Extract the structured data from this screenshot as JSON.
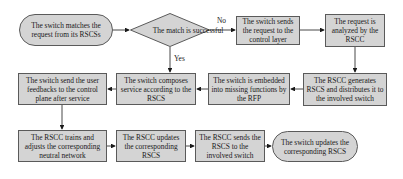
{
  "diagram": {
    "type": "flowchart",
    "colors": {
      "node_fill": "#d4d4d4",
      "node_border": "#5a5a5a",
      "arrow": "#1a1a1a"
    },
    "nodes": {
      "start": {
        "shape": "rounded",
        "text": "The switch matches the request from its RSCSs"
      },
      "decision": {
        "shape": "diamond",
        "text": "The match is successful"
      },
      "send_request": {
        "shape": "rect",
        "text": "The switch sends the request to the control layer"
      },
      "analyzed": {
        "shape": "rect",
        "text": "The request is analyzed by the RSCC"
      },
      "generates": {
        "shape": "rect",
        "text": "The RSCC generates RSCS and distributes it to the involved switch"
      },
      "embedded": {
        "shape": "rect",
        "text": "The switch is embedded into missing functions by the RFP"
      },
      "composes": {
        "shape": "rect",
        "text": "The switch composes service according to the RSCS"
      },
      "feedback": {
        "shape": "rect",
        "text": "The switch send the user feedbacks to the control plane after service"
      },
      "trains": {
        "shape": "rect",
        "text": "The RSCC trains and adjusts the corresponding neutral network"
      },
      "updates": {
        "shape": "rect",
        "text": "The RSCC updates the corresponding RSCS"
      },
      "sends_rscs": {
        "shape": "rect",
        "text": "The RSCC sends the RSCS to the involved switch"
      },
      "end": {
        "shape": "rounded",
        "text": "The switch updates the corresponding RSCS"
      }
    },
    "edge_labels": {
      "no": "No",
      "yes": "Yes"
    },
    "edges": [
      [
        "start",
        "decision"
      ],
      [
        "decision",
        "send_request",
        "No"
      ],
      [
        "send_request",
        "analyzed"
      ],
      [
        "analyzed",
        "generates"
      ],
      [
        "generates",
        "embedded"
      ],
      [
        "embedded",
        "composes"
      ],
      [
        "decision",
        "composes",
        "Yes"
      ],
      [
        "composes",
        "feedback"
      ],
      [
        "feedback",
        "trains"
      ],
      [
        "trains",
        "updates"
      ],
      [
        "updates",
        "sends_rscs"
      ],
      [
        "sends_rscs",
        "end"
      ]
    ]
  }
}
